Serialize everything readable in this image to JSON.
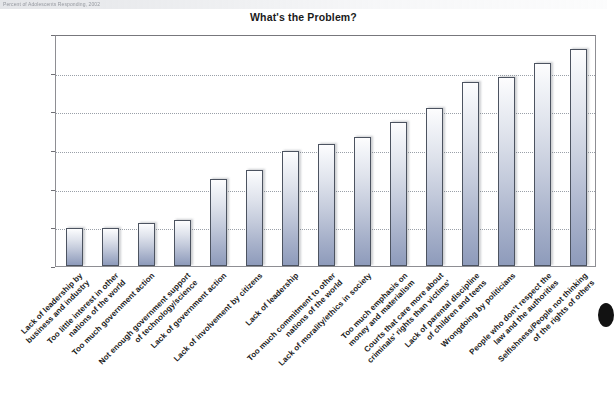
{
  "page": {
    "scan_header_text": "Percent of Adolescents Responding, 2002"
  },
  "chart_data": {
    "type": "bar",
    "title": "What's the Problem?",
    "xlabel": "",
    "ylabel": "Percent of Adolescents Responding",
    "ylim": [
      0,
      60
    ],
    "yticks": [
      0,
      10,
      20,
      30,
      40,
      50,
      60
    ],
    "grid": true,
    "legend": null,
    "categories": [
      "Lack of leadership by business and industry",
      "Too little interest in other nations of the world",
      "Too much government action",
      "Not enough government support of technology/science",
      "Lack of government action",
      "Lack of involvement by citizens",
      "Lack of leadership",
      "Too much commitment to other nations of the world",
      "Lack of morality/ethics in society",
      "Too much emphasis on money and materialism",
      "Courts that care more about criminals' rights than victims'",
      "Lack of parental discipline of children and teens",
      "Wrongdoing by politicians",
      "People who don't respect the law and the authorities",
      "Selfishness/People not thinking of the rights of others"
    ],
    "category_lines": [
      [
        "Lack of leadership by",
        "business and industry"
      ],
      [
        "Too little interest in other",
        "nations of the world"
      ],
      [
        "Too much government action"
      ],
      [
        "Not enough government support",
        "of technology/science"
      ],
      [
        "Lack of government action"
      ],
      [
        "Lack of involvement by citizens"
      ],
      [
        "Lack of leadership"
      ],
      [
        "Too much commitment to other",
        "nations of the world"
      ],
      [
        "Lack of morality/ethics in society"
      ],
      [
        "Too much emphasis on",
        "money and materialism"
      ],
      [
        "Courts that care more about",
        "criminals' rights than victims'"
      ],
      [
        "Lack of parental discipline",
        "of children and teens"
      ],
      [
        "Wrongdoing by politicians"
      ],
      [
        "People who don't respect the",
        "law and the authorities"
      ],
      [
        "Selfishness/People not thinking",
        "of the rights of others"
      ]
    ],
    "values": [
      9.8,
      9.9,
      11.1,
      12.0,
      22.6,
      24.8,
      29.7,
      31.6,
      33.4,
      37.2,
      40.8,
      47.6,
      48.8,
      52.6,
      56.2
    ],
    "colors": {
      "bar_top": "#fdfdfe",
      "bar_bottom": "#8e9bbb",
      "bar_border": "#4c5360",
      "grid": "#9aa0a8",
      "axis": "#8e8e93",
      "text": "#1a1a1a",
      "background": "#ffffff"
    }
  }
}
